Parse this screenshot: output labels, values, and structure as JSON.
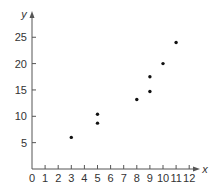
{
  "chart_data": {
    "type": "scatter",
    "title": "",
    "xlabel": "x",
    "ylabel": "y",
    "xlim": [
      0,
      12
    ],
    "ylim": [
      0,
      27
    ],
    "x_ticks": [
      0,
      1,
      2,
      3,
      4,
      5,
      6,
      7,
      8,
      9,
      10,
      11,
      12
    ],
    "y_ticks": [
      5,
      10,
      15,
      20,
      25
    ],
    "grid": false,
    "legend": null,
    "points": [
      {
        "x": 3,
        "y": 6
      },
      {
        "x": 5,
        "y": 8.7
      },
      {
        "x": 5,
        "y": 10.4
      },
      {
        "x": 8,
        "y": 13.2
      },
      {
        "x": 9,
        "y": 14.7
      },
      {
        "x": 9,
        "y": 17.5
      },
      {
        "x": 10,
        "y": 20
      },
      {
        "x": 11,
        "y": 24
      }
    ]
  },
  "style": {
    "axis_color": "#555555",
    "point_color": "#111111",
    "background": "#ffffff"
  }
}
